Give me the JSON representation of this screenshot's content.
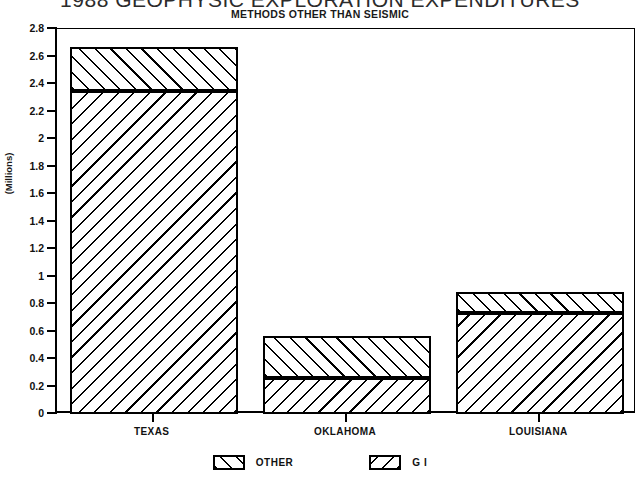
{
  "chart_data": {
    "type": "bar",
    "title": "1988 GEOPHYSIC EXPLORATION EXPENDITURES",
    "subtitle": "METHODS OTHER THAN SEISMIC",
    "xlabel": "",
    "ylabel": "(Millions)",
    "categories": [
      "TEXAS",
      "OKLAHOMA",
      "LOUISIANA"
    ],
    "stacked": true,
    "series": [
      {
        "name": "G I",
        "values": [
          2.35,
          0.265,
          0.735
        ]
      },
      {
        "name": "OTHER",
        "values": [
          0.32,
          0.305,
          0.155
        ]
      }
    ],
    "totals": [
      2.67,
      0.57,
      0.89
    ],
    "ylim": [
      0,
      2.8
    ],
    "ytick_step": 0.2,
    "yticks": [
      "0",
      "0.2",
      "0.4",
      "0.6",
      "0.8",
      "1",
      "1.2",
      "1.4",
      "1.6",
      "1.8",
      "2",
      "2.2",
      "2.4",
      "2.6",
      "2.8"
    ],
    "grid": false,
    "legend_position": "bottom",
    "legend": [
      {
        "label": "OTHER",
        "hatch": "forward-slash"
      },
      {
        "label": "G I",
        "hatch": "back-slash"
      }
    ],
    "colors": {
      "ink": "#000000",
      "background": "#ffffff"
    }
  }
}
